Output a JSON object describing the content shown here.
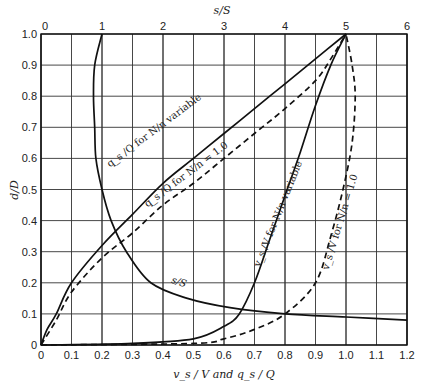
{
  "chart_data": {
    "type": "line",
    "title": "",
    "xlabel": "v_s/V and q_s/Q",
    "ylabel": "d/D",
    "x2label": "s/S",
    "xlim": [
      0,
      1.2
    ],
    "ylim": [
      0,
      1.0
    ],
    "x2lim": [
      0,
      6
    ],
    "grid": true,
    "x_ticks": [
      "0",
      "0.1",
      "0.2",
      "0.3",
      "0.4",
      "0.5",
      "0.6",
      "0.7",
      "0.8",
      "0.9",
      "1.0",
      "1.1",
      "1.2"
    ],
    "x2_ticks": [
      "0",
      "1",
      "2",
      "3",
      "4",
      "5",
      "6"
    ],
    "y_ticks": [
      "0",
      "0.1",
      "0.2",
      "0.3",
      "0.4",
      "0.5",
      "0.6",
      "0.7",
      "0.8",
      "0.9",
      "1.0"
    ],
    "series": [
      {
        "name": "q_s/Q for N/n variable",
        "style": "solid",
        "axis": "bottom",
        "points": [
          [
            0,
            0
          ],
          [
            0.02,
            0.05
          ],
          [
            0.05,
            0.1
          ],
          [
            0.1,
            0.2
          ],
          [
            0.2,
            0.32
          ],
          [
            0.3,
            0.42
          ],
          [
            0.4,
            0.52
          ],
          [
            0.5,
            0.6
          ],
          [
            0.6,
            0.68
          ],
          [
            0.7,
            0.76
          ],
          [
            0.8,
            0.84
          ],
          [
            0.9,
            0.92
          ],
          [
            1.0,
            1.0
          ]
        ]
      },
      {
        "name": "q_s/Q for N/n = 1.0",
        "style": "dashed",
        "axis": "bottom",
        "points": [
          [
            0,
            0
          ],
          [
            0.05,
            0.08
          ],
          [
            0.1,
            0.17
          ],
          [
            0.2,
            0.28
          ],
          [
            0.3,
            0.36
          ],
          [
            0.4,
            0.45
          ],
          [
            0.5,
            0.52
          ],
          [
            0.6,
            0.6
          ],
          [
            0.7,
            0.68
          ],
          [
            0.8,
            0.76
          ],
          [
            0.9,
            0.85
          ],
          [
            0.95,
            0.92
          ],
          [
            1.0,
            1.0
          ]
        ]
      },
      {
        "name": "v_s/V for N/n variable",
        "style": "solid",
        "axis": "bottom",
        "points": [
          [
            0,
            0
          ],
          [
            0.3,
            0.005
          ],
          [
            0.5,
            0.02
          ],
          [
            0.6,
            0.06
          ],
          [
            0.65,
            0.1
          ],
          [
            0.7,
            0.2
          ],
          [
            0.75,
            0.34
          ],
          [
            0.8,
            0.48
          ],
          [
            0.85,
            0.62
          ],
          [
            0.9,
            0.77
          ],
          [
            0.95,
            0.9
          ],
          [
            1.0,
            1.0
          ]
        ]
      },
      {
        "name": "v_s/V for N/n = 1.0",
        "style": "dashed",
        "axis": "bottom",
        "points": [
          [
            0,
            0
          ],
          [
            0.5,
            0.005
          ],
          [
            0.6,
            0.02
          ],
          [
            0.7,
            0.05
          ],
          [
            0.8,
            0.1
          ],
          [
            0.9,
            0.2
          ],
          [
            0.95,
            0.35
          ],
          [
            0.99,
            0.5
          ],
          [
            1.02,
            0.65
          ],
          [
            1.03,
            0.8
          ],
          [
            1.02,
            0.9
          ],
          [
            1.0,
            1.0
          ]
        ]
      },
      {
        "name": "s/S",
        "style": "solid",
        "axis": "top",
        "points": [
          [
            1.0,
            1.0
          ],
          [
            0.88,
            0.9
          ],
          [
            0.86,
            0.8
          ],
          [
            0.88,
            0.7
          ],
          [
            0.9,
            0.6
          ],
          [
            1.0,
            0.5
          ],
          [
            1.15,
            0.4
          ],
          [
            1.4,
            0.3
          ],
          [
            1.8,
            0.2
          ],
          [
            2.4,
            0.15
          ],
          [
            3.1,
            0.12
          ],
          [
            4.0,
            0.1
          ],
          [
            5.0,
            0.09
          ],
          [
            6.0,
            0.08
          ]
        ]
      }
    ],
    "annotations": [
      {
        "text": "q_s/Q for N/n variable",
        "x": 0.38,
        "y": 0.58,
        "angle": -37
      },
      {
        "text": "q_s/Q for N/n = 1.0",
        "x": 0.48,
        "y": 0.47,
        "angle": -37
      },
      {
        "text": "v_s/V for N/n variable",
        "x": 0.79,
        "y": 0.37,
        "angle": -68
      },
      {
        "text": "v_s/V for N/n = 1.0",
        "x": 0.9,
        "y": 0.42,
        "angle": -72
      },
      {
        "text": "s/S",
        "x": 0.43,
        "y": 0.18,
        "angle": 18
      }
    ]
  },
  "labels": {
    "x_axis": "v_s / V and q_s / Q",
    "x2_axis": "s/S",
    "y_axis": "d/D",
    "qs_var": "q_s /Q for N/n variable",
    "qs_one": "q_s /Q for N/n = 1.0",
    "vs_var": "v_s /V for N/n variable",
    "vs_one": "v_s /V for N/n = 1.0",
    "sS": "s/S"
  }
}
